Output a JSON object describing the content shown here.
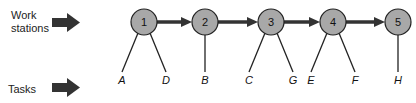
{
  "labels": {
    "work_stations": "Work\nstations",
    "work_line1": "Work",
    "work_line2": "stations",
    "tasks": "Tasks"
  },
  "colors": {
    "node_fill": "#a8a8a8",
    "stroke": "#222222",
    "arrow": "#333333"
  },
  "stations": [
    {
      "id": "1",
      "x": 144,
      "tasks": [
        "A",
        "D"
      ]
    },
    {
      "id": "2",
      "x": 205,
      "tasks": [
        "B"
      ]
    },
    {
      "id": "3",
      "x": 271,
      "tasks": [
        "C",
        "G"
      ]
    },
    {
      "id": "4",
      "x": 333,
      "tasks": [
        "E",
        "F"
      ]
    },
    {
      "id": "5",
      "x": 398,
      "tasks": [
        "H"
      ]
    }
  ]
}
